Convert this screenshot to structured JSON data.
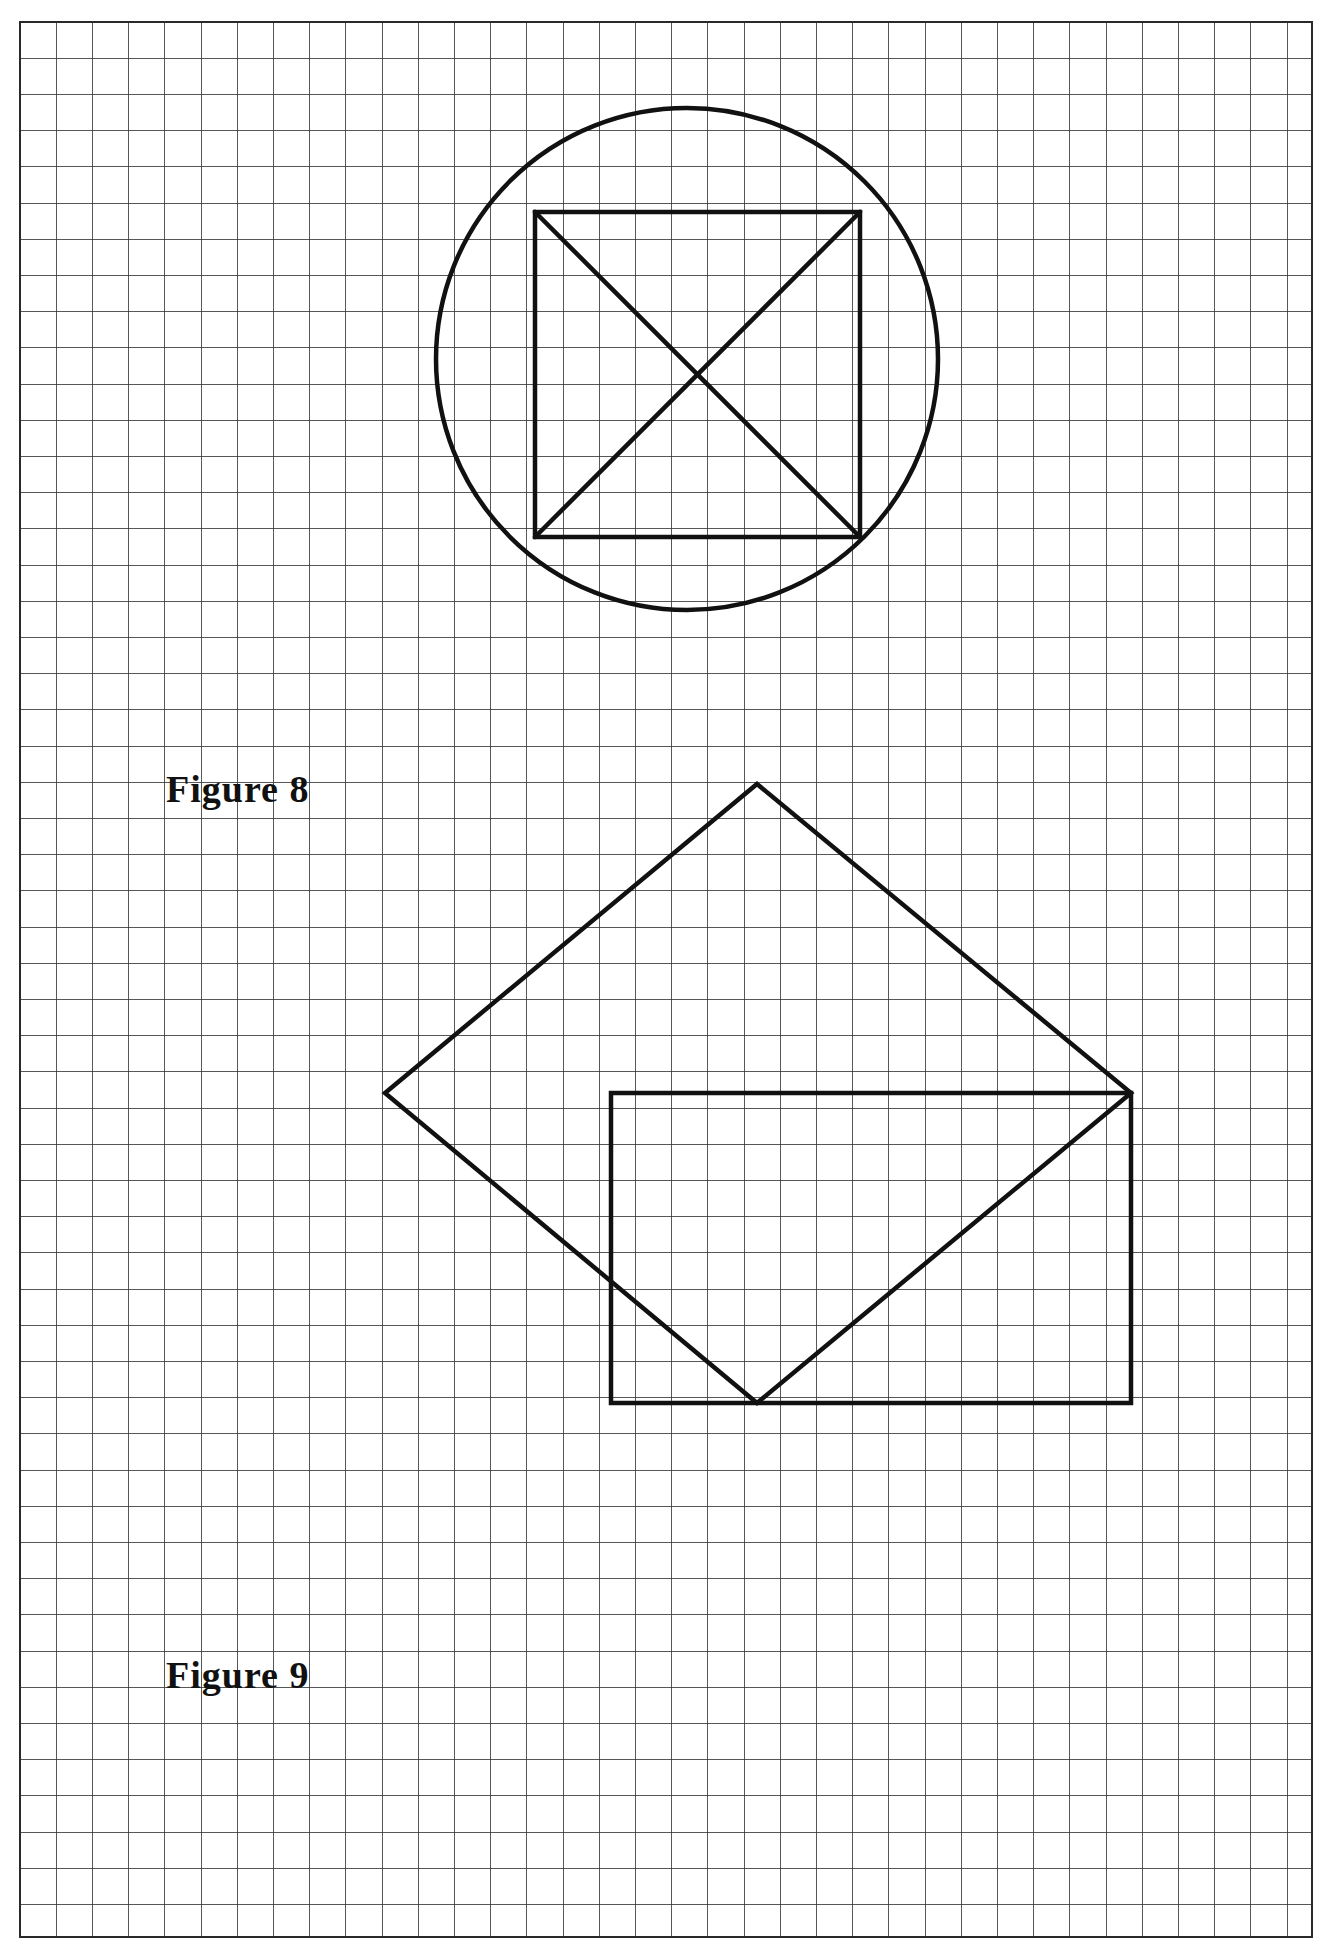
{
  "page": {
    "kind": "graph-paper-worksheet",
    "width": 1325,
    "height": 1950,
    "background_color": "#ffffff"
  },
  "grid": {
    "name": "graph-paper-grid",
    "origin_x": 20,
    "origin_y": 22,
    "right": 1312,
    "bottom": 1937,
    "cell_size": 36.2,
    "columns": 36,
    "rows": 53,
    "minor_line_color": "#3a3a3a",
    "minor_line_width": 1,
    "border_color": "#2a2a2a",
    "border_width": 1.6
  },
  "figures": [
    {
      "id": "figure-8",
      "label": "Figure 8",
      "label_x": 166,
      "label_y": 770,
      "description": "Circle with an inscribed square and both of its diagonals",
      "stroke_color": "#111111",
      "stroke_width": 4.5,
      "circle": {
        "cx": 687,
        "cy": 359,
        "r": 251
      },
      "square": {
        "points": "535,212 860,212 860,537 535,537",
        "top_left": [
          535,
          212
        ],
        "top_right": [
          860,
          212
        ],
        "bottom_right": [
          860,
          537
        ],
        "bottom_left": [
          535,
          537
        ],
        "side": 325
      },
      "diagonals": [
        {
          "x1": 535,
          "y1": 212,
          "x2": 860,
          "y2": 537
        },
        {
          "x1": 860,
          "y1": 212,
          "x2": 535,
          "y2": 537
        }
      ]
    },
    {
      "id": "figure-9",
      "label": "Figure 9",
      "label_x": 166,
      "label_y": 1656,
      "description": "Rotated square (diamond) overlapping an axis-aligned square sharing the lower-right region",
      "stroke_color": "#111111",
      "stroke_width": 4.5,
      "diamond": {
        "points": "757,784 1131,1093 757,1403 385,1093",
        "top": [
          757,
          784
        ],
        "right": [
          1131,
          1093
        ],
        "bottom": [
          757,
          1403
        ],
        "left": [
          385,
          1093
        ]
      },
      "square": {
        "points": "611,1093 1131,1093 1131,1403 611,1403",
        "top_left": [
          611,
          1093
        ],
        "top_right": [
          1131,
          1093
        ],
        "bottom_right": [
          1131,
          1403
        ],
        "bottom_left": [
          611,
          1403
        ]
      }
    }
  ],
  "labels": {
    "figure8": "Figure 8",
    "figure9": "Figure 9"
  }
}
